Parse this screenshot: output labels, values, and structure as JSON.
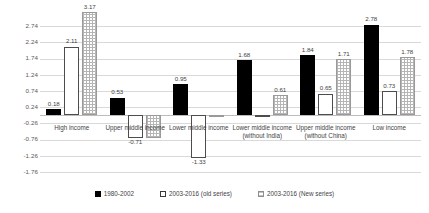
{
  "chart_data": {
    "type": "bar",
    "title": "",
    "xlabel": "",
    "ylabel": "",
    "ylim": [
      -2.01,
      2.99
    ],
    "yticks": [
      "2.74",
      "2.24",
      "1.74",
      "1.24",
      "0.74",
      "0.24",
      "-0.26",
      "-0.76",
      "-1.26",
      "-1.76"
    ],
    "ytick_values": [
      2.74,
      2.24,
      1.74,
      1.24,
      0.74,
      0.24,
      -0.26,
      -0.76,
      -1.26,
      -1.76
    ],
    "grid": true,
    "legend_position": "bottom",
    "categories": [
      "High income",
      "Upper middle income",
      "Lower middle income",
      "Lower middle income (without India)",
      "Upper middle income (without China)",
      "Low income"
    ],
    "series": [
      {
        "name": "1980-2002",
        "style": "solid-black",
        "color": "#000000",
        "values": [
          0.18,
          0.53,
          0.95,
          1.68,
          1.84,
          2.78
        ],
        "labels": [
          "0.18",
          "0.53",
          "0.95",
          "1.68",
          "1.84",
          "2.78"
        ]
      },
      {
        "name": "2003-2016 (old series)",
        "style": "white-outline",
        "color": "#ffffff",
        "values": [
          2.11,
          -0.71,
          -1.33,
          -0.06,
          0.65,
          0.73
        ],
        "labels": [
          "2.11",
          "-0.71",
          "-1.33",
          "",
          "0.65",
          "0.73"
        ]
      },
      {
        "name": "2003-2016 (New series)",
        "style": "dotted-fill",
        "color": "#ffffff",
        "values": [
          3.17,
          -0.71,
          0.0,
          0.61,
          1.71,
          1.78
        ],
        "labels": [
          "3.17",
          "",
          "",
          "0.61",
          "1.71",
          "1.78"
        ]
      }
    ]
  },
  "legend": {
    "items": [
      "1980-2002",
      "2003-2016 (old series)",
      "2003-2016 (New series)"
    ]
  }
}
